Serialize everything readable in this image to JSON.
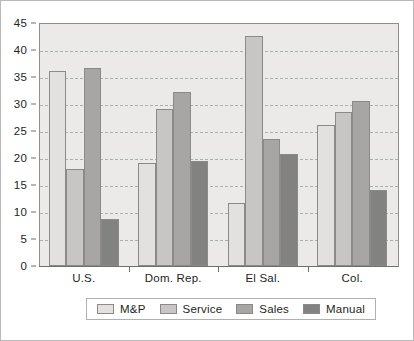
{
  "chart_data": {
    "type": "bar",
    "title": "",
    "subtitle": "",
    "xlabel": "",
    "ylabel": "",
    "categories": [
      "U.S.",
      "Dom. Rep.",
      "El Sal.",
      "Col."
    ],
    "series": [
      {
        "name": "M&P",
        "color": "#e3e1df",
        "values": [
          36.1,
          19.0,
          11.7,
          26.1
        ]
      },
      {
        "name": "Service",
        "color": "#c8c6c4",
        "values": [
          18.0,
          29.1,
          42.6,
          28.6
        ]
      },
      {
        "name": "Sales",
        "color": "#a8a6a4",
        "values": [
          36.7,
          32.2,
          23.5,
          30.6
        ]
      },
      {
        "name": "Manual",
        "color": "#828280",
        "values": [
          8.7,
          19.5,
          20.8,
          14.0
        ]
      }
    ],
    "ylim": [
      0,
      45
    ],
    "yticks": [
      0,
      5,
      10,
      15,
      20,
      25,
      30,
      35,
      40,
      45
    ],
    "ytick_labels": [
      "0",
      "5",
      "10",
      "15",
      "20",
      "25",
      "30",
      "35",
      "40",
      "45"
    ],
    "grid": true,
    "grid_axis": "y",
    "legend_position": "bottom",
    "plot_background": "#eceae8",
    "gridline_color": "#9aa7b4",
    "axis_color": "#6f6f6f",
    "text_color": "#231f20",
    "bar_border_color": "#8a8a8a"
  }
}
